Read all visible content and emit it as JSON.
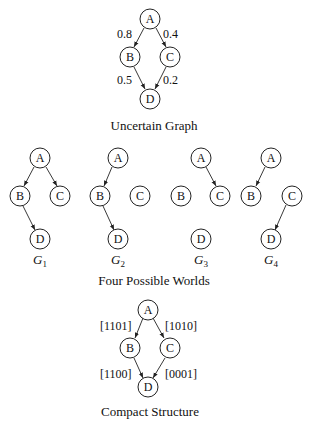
{
  "uncertain_graph": {
    "caption": "Uncertain Graph",
    "nodes": [
      "A",
      "B",
      "C",
      "D"
    ],
    "edges": [
      {
        "from": "A",
        "to": "B",
        "label": "0.8"
      },
      {
        "from": "A",
        "to": "C",
        "label": "0.4"
      },
      {
        "from": "B",
        "to": "D",
        "label": "0.5"
      },
      {
        "from": "C",
        "to": "D",
        "label": "0.2"
      }
    ]
  },
  "possible_worlds": {
    "caption": "Four Possible Worlds",
    "worlds": [
      {
        "label": "G",
        "sub": "1",
        "edges": [
          "A-B",
          "A-C",
          "B-D"
        ]
      },
      {
        "label": "G",
        "sub": "2",
        "edges": [
          "A-B",
          "B-D"
        ]
      },
      {
        "label": "G",
        "sub": "3",
        "edges": [
          "A-C"
        ]
      },
      {
        "label": "G",
        "sub": "4",
        "edges": [
          "A-B",
          "C-D"
        ]
      }
    ]
  },
  "compact_structure": {
    "caption": "Compact Structure",
    "edges": [
      {
        "from": "A",
        "to": "B",
        "label": "[1101]"
      },
      {
        "from": "A",
        "to": "C",
        "label": "[1010]"
      },
      {
        "from": "B",
        "to": "D",
        "label": "[1100]"
      },
      {
        "from": "C",
        "to": "D",
        "label": "[0001]"
      }
    ]
  }
}
